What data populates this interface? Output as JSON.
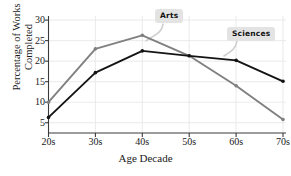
{
  "chart_data": {
    "type": "line",
    "title": "",
    "xlabel": "Age Decade",
    "ylabel_line1": "Percentage of Works",
    "ylabel_line2": "Completed",
    "categories": [
      "20s",
      "30s",
      "40s",
      "50s",
      "60s",
      "70s"
    ],
    "xticklabels": [
      "20s",
      "30s",
      "40s",
      "50s",
      "60s",
      "70s"
    ],
    "yticklabels": [
      "5",
      "10",
      "15",
      "20",
      "25",
      "30"
    ],
    "ytickvalues": [
      5,
      10,
      15,
      20,
      25,
      30
    ],
    "ylim": [
      2.5,
      31
    ],
    "grid": true,
    "legend_position": "inline-callouts",
    "series": [
      {
        "name": "Arts",
        "color": "#808080",
        "values": [
          10.0,
          23.0,
          26.3,
          21.3,
          14.0,
          5.8
        ]
      },
      {
        "name": "Sciences",
        "color": "#141414",
        "values": [
          6.3,
          17.2,
          22.5,
          21.3,
          20.2,
          15.1
        ]
      }
    ],
    "annotations": [
      {
        "label": "Arts",
        "points_to_series": "Arts",
        "points_to_category": "40s"
      },
      {
        "label": "Sciences",
        "points_to_series": "Sciences",
        "points_to_category": "60s"
      }
    ]
  },
  "axes": {
    "xlabel": "Age Decade",
    "ylabel_line1": "Percentage of Works",
    "ylabel_line2": "Completed"
  },
  "callouts": {
    "arts": "Arts",
    "sciences": "Sciences"
  },
  "title_sliver": ""
}
